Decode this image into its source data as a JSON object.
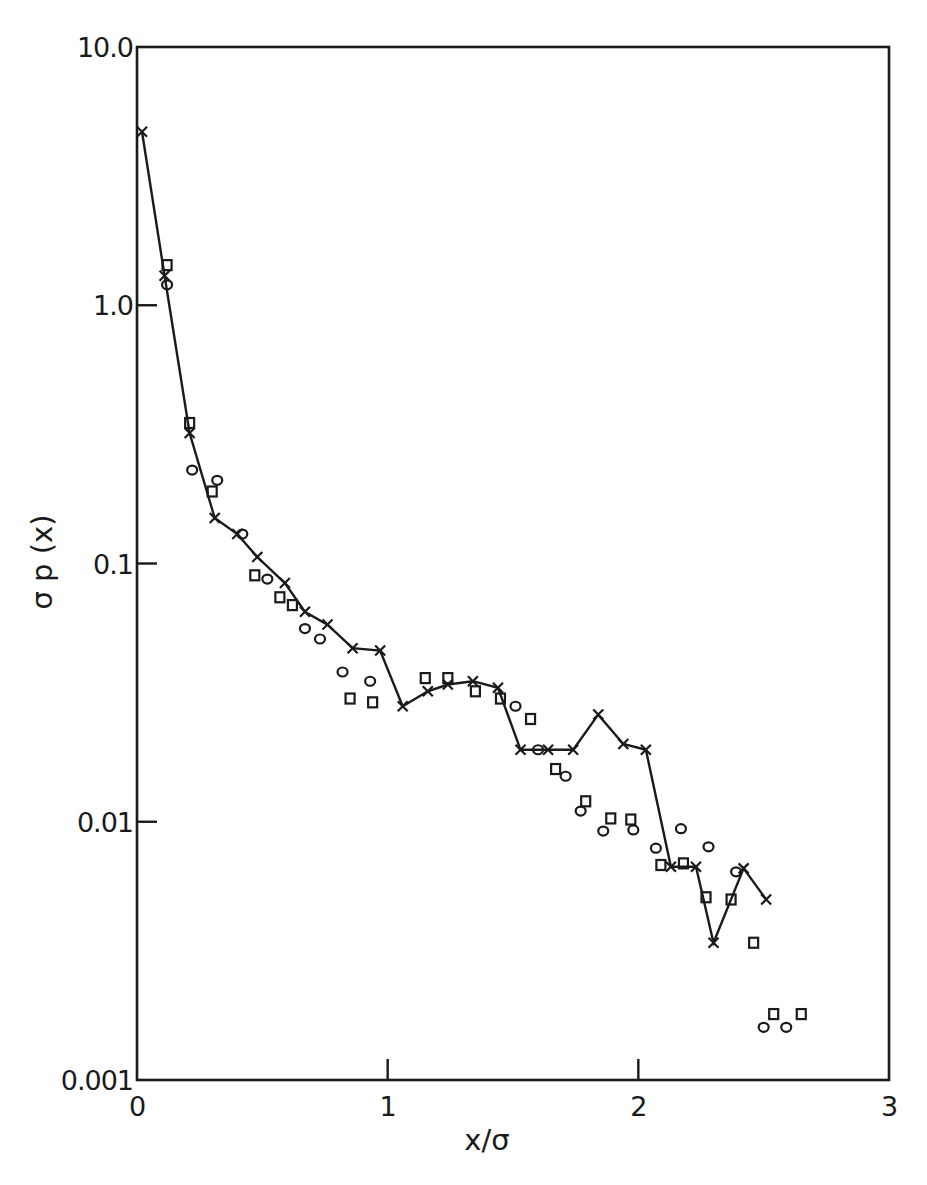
{
  "chart_data": {
    "type": "scatter",
    "title": "",
    "xlabel": "x/σ",
    "ylabel": "σ p (x)",
    "xlim": [
      0,
      3
    ],
    "ylim": [
      0.001,
      10.0
    ],
    "yscale": "log",
    "grid": false,
    "legend": null,
    "x_ticks": [
      {
        "value": 0,
        "label": "0"
      },
      {
        "value": 1,
        "label": "1"
      },
      {
        "value": 2,
        "label": "2"
      },
      {
        "value": 3,
        "label": "3"
      }
    ],
    "y_ticks": [
      {
        "value": 10.0,
        "label": "10.0"
      },
      {
        "value": 1.0,
        "label": "1.0"
      },
      {
        "value": 0.1,
        "label": "0.1"
      },
      {
        "value": 0.01,
        "label": "0.01"
      },
      {
        "value": 0.001,
        "label": "0.001"
      }
    ],
    "series": [
      {
        "name": "crosses (joined by line)",
        "marker": "x",
        "line": true,
        "x": [
          0.02,
          0.11,
          0.21,
          0.31,
          0.4,
          0.48,
          0.59,
          0.67,
          0.76,
          0.86,
          0.97,
          1.06,
          1.16,
          1.24,
          1.34,
          1.44,
          1.53,
          1.64,
          1.74,
          1.84,
          1.94,
          2.03,
          2.13,
          2.23,
          2.3,
          2.42,
          2.51
        ],
        "y": [
          4.7,
          1.3,
          0.32,
          0.15,
          0.13,
          0.106,
          0.084,
          0.065,
          0.058,
          0.047,
          0.046,
          0.028,
          0.032,
          0.034,
          0.035,
          0.033,
          0.019,
          0.019,
          0.019,
          0.026,
          0.02,
          0.019,
          0.0067,
          0.0067,
          0.0034,
          0.0066,
          0.005
        ]
      },
      {
        "name": "squares",
        "marker": "square",
        "line": false,
        "x": [
          0.12,
          0.21,
          0.3,
          0.47,
          0.57,
          0.62,
          0.85,
          0.94,
          1.15,
          1.24,
          1.35,
          1.45,
          1.57,
          1.67,
          1.79,
          1.89,
          1.97,
          2.09,
          2.18,
          2.27,
          2.37,
          2.46,
          2.54,
          2.65
        ],
        "y": [
          1.43,
          0.35,
          0.19,
          0.09,
          0.074,
          0.069,
          0.03,
          0.029,
          0.036,
          0.036,
          0.032,
          0.03,
          0.025,
          0.016,
          0.012,
          0.0103,
          0.0102,
          0.0068,
          0.0069,
          0.0051,
          0.005,
          0.0034,
          0.0018,
          0.0018
        ]
      },
      {
        "name": "circles",
        "marker": "circle",
        "line": false,
        "x": [
          0.12,
          0.22,
          0.32,
          0.42,
          0.52,
          0.67,
          0.73,
          0.82,
          0.93,
          1.51,
          1.6,
          1.71,
          1.77,
          1.86,
          1.98,
          2.07,
          2.17,
          2.28,
          2.39,
          2.5,
          2.59
        ],
        "y": [
          1.2,
          0.23,
          0.21,
          0.13,
          0.087,
          0.056,
          0.051,
          0.038,
          0.035,
          0.028,
          0.019,
          0.015,
          0.011,
          0.0092,
          0.0093,
          0.0079,
          0.0094,
          0.008,
          0.0064,
          0.0016,
          0.0016
        ]
      }
    ]
  }
}
